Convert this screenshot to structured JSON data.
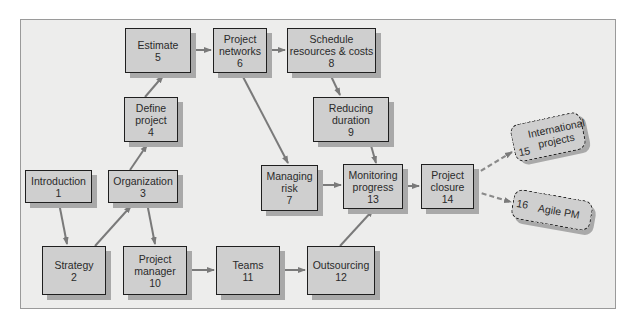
{
  "diagram": {
    "nodes": [
      {
        "id": "1",
        "label": "Introduction",
        "number": "1"
      },
      {
        "id": "2",
        "label": "Strategy",
        "number": "2"
      },
      {
        "id": "3",
        "label": "Organization",
        "number": "3"
      },
      {
        "id": "4",
        "label": "Define project",
        "number": "4"
      },
      {
        "id": "5",
        "label": "Estimate",
        "number": "5"
      },
      {
        "id": "6",
        "label": "Project networks",
        "number": "6"
      },
      {
        "id": "7",
        "label": "Managing risk",
        "number": "7"
      },
      {
        "id": "8",
        "label": "Schedule resources & costs",
        "number": "8"
      },
      {
        "id": "9",
        "label": "Reducing duration",
        "number": "9"
      },
      {
        "id": "10",
        "label": "Project manager",
        "number": "10"
      },
      {
        "id": "11",
        "label": "Teams",
        "number": "11"
      },
      {
        "id": "12",
        "label": "Outsourcing",
        "number": "12"
      },
      {
        "id": "13",
        "label": "Monitoring progress",
        "number": "13"
      },
      {
        "id": "14",
        "label": "Project closure",
        "number": "14"
      },
      {
        "id": "15",
        "label": "International projects",
        "number": "15"
      },
      {
        "id": "16",
        "label": "Agile PM",
        "number": "16"
      }
    ],
    "text": {
      "n1a": "Introduction",
      "n1b": "1",
      "n2a": "Strategy",
      "n2b": "2",
      "n3a": "Organization",
      "n3b": "3",
      "n4a": "Define",
      "n4b": "project",
      "n4c": "4",
      "n5a": "Estimate",
      "n5b": "5",
      "n6a": "Project",
      "n6b": "networks",
      "n6c": "6",
      "n7a": "Managing",
      "n7b": "risk",
      "n7c": "7",
      "n8a": "Schedule",
      "n8b": "resources & costs",
      "n8c": "8",
      "n9a": "Reducing",
      "n9b": "duration",
      "n9c": "9",
      "n10a": "Project",
      "n10b": "manager",
      "n10c": "10",
      "n11a": "Teams",
      "n11b": "11",
      "n12a": "Outsourcing",
      "n12b": "12",
      "n13a": "Monitoring",
      "n13b": "progress",
      "n13c": "13",
      "n14a": "Project",
      "n14b": "closure",
      "n14c": "14",
      "n15a": "International",
      "n15b": "projects",
      "n15c": "15",
      "n16a": "Agile PM",
      "n16c": "16"
    },
    "edges": [
      {
        "from": "1",
        "to": "2",
        "style": "solid"
      },
      {
        "from": "2",
        "to": "3",
        "style": "solid"
      },
      {
        "from": "3",
        "to": "4",
        "style": "solid"
      },
      {
        "from": "4",
        "to": "5",
        "style": "solid"
      },
      {
        "from": "5",
        "to": "6",
        "style": "solid"
      },
      {
        "from": "6",
        "to": "8",
        "style": "solid"
      },
      {
        "from": "6",
        "to": "7",
        "style": "solid"
      },
      {
        "from": "8",
        "to": "9",
        "style": "solid"
      },
      {
        "from": "9",
        "to": "13",
        "style": "solid"
      },
      {
        "from": "7",
        "to": "13",
        "style": "solid"
      },
      {
        "from": "3",
        "to": "10",
        "style": "solid"
      },
      {
        "from": "10",
        "to": "11",
        "style": "solid"
      },
      {
        "from": "11",
        "to": "12",
        "style": "solid"
      },
      {
        "from": "12",
        "to": "13",
        "style": "solid"
      },
      {
        "from": "13",
        "to": "14",
        "style": "solid"
      },
      {
        "from": "14",
        "to": "15",
        "style": "dashed"
      },
      {
        "from": "14",
        "to": "16",
        "style": "dashed"
      }
    ],
    "colors": {
      "node_fill": "#cfcfcf",
      "border": "#1f1f1f",
      "edge": "#7a7a7a",
      "panel": "#ededec",
      "shadow": "#a9a9a9"
    }
  }
}
